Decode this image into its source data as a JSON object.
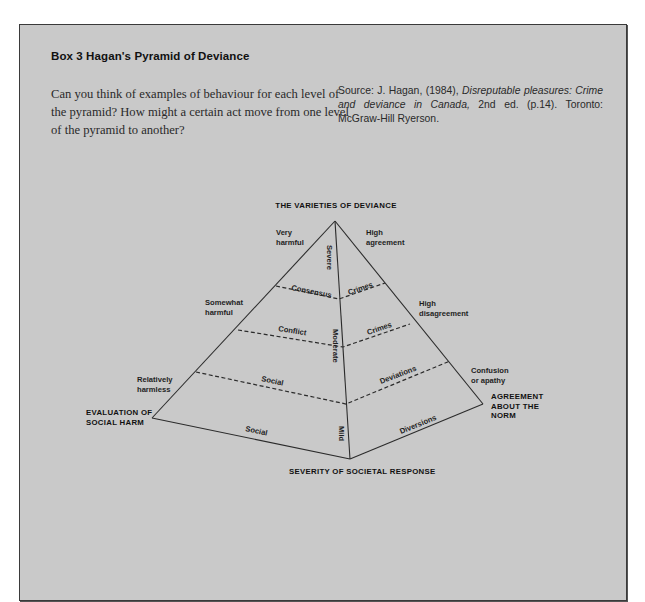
{
  "box": {
    "title": "Box 3  Hagan's Pyramid of Deviance",
    "question": "Can you think of examples of behaviour for each level of the pyramid? How might a certain act move from one level of the pyramid to another?",
    "source": {
      "prefix": "Source: J. Hagan, (1984), ",
      "title_italic": "Disreputable pleasures: Crime and deviance in Canada,",
      "suffix": " 2nd ed. (p.14). Toronto: McGraw-Hill Ryerson."
    }
  },
  "diagram": {
    "title": "THE VARIETIES OF DEVIANCE",
    "bottom_axis_label": "SEVERITY OF SOCIETAL RESPONSE",
    "left_axis_label": [
      "EVALUATION OF",
      "SOCIAL HARM"
    ],
    "right_axis_label": [
      "AGREEMENT",
      "ABOUT THE",
      "NORM"
    ],
    "harm_labels": {
      "very": [
        "Very",
        "harmful"
      ],
      "somewhat": [
        "Somewhat",
        "harmful"
      ],
      "relatively": [
        "Relatively",
        "harmless"
      ]
    },
    "agreement_labels": {
      "high": [
        "High",
        "agreement"
      ],
      "disagreement": [
        "High",
        "disagreement"
      ],
      "confusion": [
        "Confusion",
        "or apathy"
      ]
    },
    "severity_labels": {
      "severe": "Severe",
      "moderate": "Moderate",
      "mild": "Mild"
    },
    "left_face_labels": {
      "consensus": "Consensus",
      "conflict": "Conflict",
      "social_dashed": "Social",
      "social_base": "Social"
    },
    "right_face_labels": {
      "crimes_top": "Crimes",
      "crimes_mid": "Crimes",
      "deviations": "Deviations",
      "diversions": "Diversions"
    },
    "colors": {
      "background": "#c9c9c9",
      "line": "#2b2b2b"
    }
  }
}
